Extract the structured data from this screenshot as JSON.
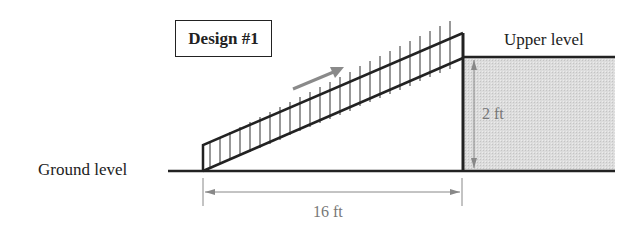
{
  "diagram": {
    "title": "Design #1",
    "labels": {
      "upper_level": "Upper level",
      "ground_level": "Ground level",
      "height_dim": "2 ft",
      "length_dim": "16 ft"
    },
    "dimensions": {
      "ramp_run_ft": 16,
      "ramp_rise_ft": 2
    },
    "colors": {
      "line": "#222222",
      "dimension": "#888888",
      "upper_fill": "#d9d9d9",
      "direction_arrow": "#8a8a8a"
    }
  }
}
